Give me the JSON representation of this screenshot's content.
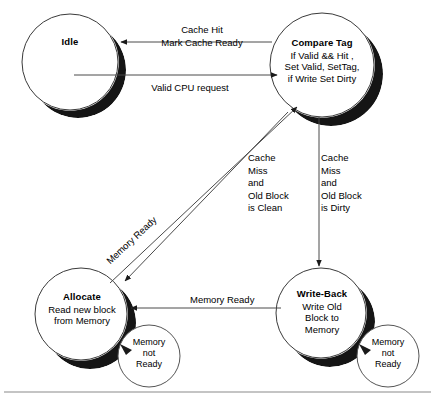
{
  "diagram": {
    "ink_color": "#1a1a1a",
    "shadow_color": "#151515",
    "background": "#ffffff",
    "rule_color": "#8a8a8a"
  },
  "states": [
    {
      "id": "idle",
      "name": "Idle",
      "body": "",
      "cx": 70,
      "cy": 62,
      "r": 48
    },
    {
      "id": "compare-tag",
      "name": "Compare Tag",
      "body": "If Valid && Hit ,\nSet Valid, SetTag,\nif Write Set Dirty",
      "cx": 322,
      "cy": 65,
      "r": 52
    },
    {
      "id": "allocate",
      "name": "Allocate",
      "body": "Read new block\nfrom Memory",
      "cx": 81,
      "cy": 314,
      "r": 46
    },
    {
      "id": "write-back",
      "name": "Write-Back",
      "body": "Write Old\nBlock to\nMemory",
      "cx": 321,
      "cy": 313,
      "r": 45
    }
  ],
  "transitions": [
    {
      "id": "hit-to-idle",
      "from": "compare-tag",
      "to": "idle",
      "label": "Cache Hit\nMark Cache Ready",
      "label_x": 182,
      "label_y": 28
    },
    {
      "id": "idle-to-compare",
      "from": "idle",
      "to": "compare-tag",
      "label": "Valid CPU request",
      "label_x": 186,
      "label_y": 80
    },
    {
      "id": "compare-to-allocate",
      "from": "compare-tag",
      "to": "allocate",
      "label": "Cache\nMiss\nand\nOld Block\nis Clean",
      "label_x": 248,
      "label_y": 158
    },
    {
      "id": "compare-to-writeback",
      "from": "compare-tag",
      "to": "write-back",
      "label": "Cache\nMiss\nand\nOld Block\nis Dirty",
      "label_x": 320,
      "label_y": 158
    },
    {
      "id": "writeback-to-allocate",
      "from": "write-back",
      "to": "allocate",
      "label": "Memory Ready",
      "label_x": 192,
      "label_y": 296
    },
    {
      "id": "allocate-to-compare",
      "from": "allocate",
      "to": "compare-tag",
      "label": "Memory Ready",
      "label_x": 104,
      "label_y": 258,
      "rotation": -45
    }
  ],
  "self_loops": [
    {
      "id": "allocate-loop",
      "state": "allocate",
      "label": "Memory\nnot\nReady",
      "cx": 149,
      "cy": 356,
      "r": 31
    },
    {
      "id": "writeback-loop",
      "state": "write-back",
      "label": "Memory\nnot\nReady",
      "cx": 388,
      "cy": 356,
      "r": 31
    }
  ],
  "footer_rule": {
    "y": 392
  }
}
